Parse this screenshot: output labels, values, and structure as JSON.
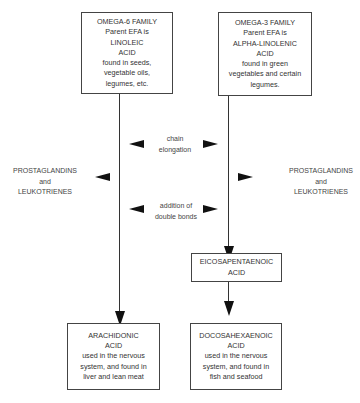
{
  "omega6_box": {
    "lines": [
      "OMEGA-6 FAMILY",
      "Parent EFA is",
      "LINOLEIC",
      "ACID",
      "found in seeds,",
      "vegetable oils,",
      "legumes, etc."
    ]
  },
  "omega3_box": {
    "lines": [
      "OMEGA-3 FAMILY",
      "Parent EFA is",
      "ALPHA-LINOLENIC",
      "ACID",
      "found in green",
      "vegetables and certain",
      "legumes."
    ]
  },
  "center_labels": {
    "chain_elongation": [
      "chain",
      "elongation"
    ],
    "double_bonds": [
      "addition of",
      "double bonds"
    ]
  },
  "left_products": [
    "PROSTAGLANDINS",
    "and",
    "LEUKOTRIENES"
  ],
  "right_products": [
    "PROSTAGLANDINS",
    "and",
    "LEUKOTRIENES"
  ],
  "epa_box": {
    "lines": [
      "EICOSAPENTAENOIC",
      "ACID"
    ]
  },
  "arachidonic_box": {
    "lines": [
      "ARACHIDONIC",
      "ACID",
      "used in the nervous",
      "system, and found in",
      "liver and lean meat"
    ]
  },
  "dha_box": {
    "lines": [
      "DOCOSAHEXAENOIC",
      "ACID",
      "used in the nervous",
      "system, and found in",
      "fish and seafood"
    ]
  }
}
